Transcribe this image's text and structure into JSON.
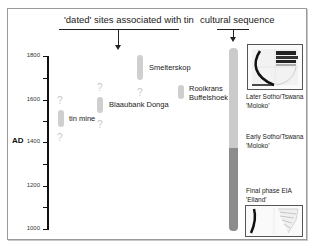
{
  "headers": {
    "sites_title": "'dated' sites associated with tin",
    "sequence_title": "cultural sequence"
  },
  "axis": {
    "unit_label": "AD",
    "ticks": [
      "1800",
      "1600",
      "1400",
      "1200",
      "1000"
    ],
    "range": [
      1000,
      1800
    ]
  },
  "sites": [
    {
      "label": "tin mine",
      "question_above": "?",
      "question_below": "?"
    },
    {
      "label": "Blaaubank Donga",
      "question_above": "?",
      "question_below": "?"
    },
    {
      "label": "Smelterskop",
      "question_below": "?"
    },
    {
      "label_line1": "Rooikrans",
      "label_line2": "Buffelshoek"
    }
  ],
  "sequence": [
    {
      "line1": "Later Sotho/Tswana",
      "line2": "'Moloko'"
    },
    {
      "line1": "Early Sotho/Tswana",
      "line2": "'Moloko'"
    },
    {
      "line1": "Final phase EIA",
      "line2": "'Eiland'"
    }
  ],
  "colors": {
    "site_bar": "#cfcfcf",
    "sequence_upper": "#cbcbcb",
    "sequence_lower": "#8c8c8c"
  }
}
